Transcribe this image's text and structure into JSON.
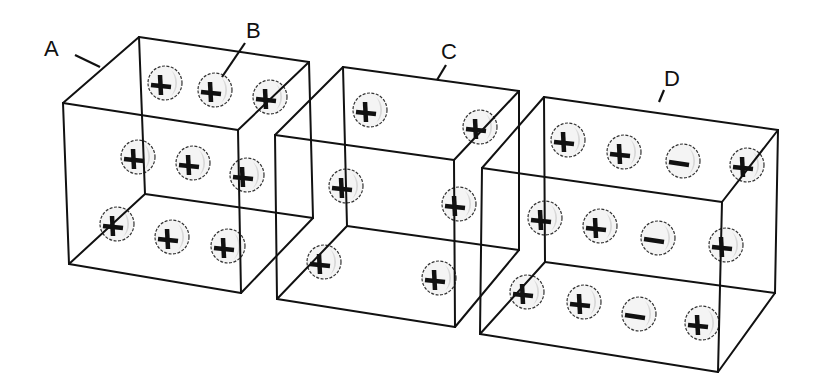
{
  "labels": {
    "A": {
      "text": "A",
      "x": 44,
      "y": 38
    },
    "B": {
      "text": "B",
      "x": 246,
      "y": 20
    },
    "C": {
      "text": "C",
      "x": 441,
      "y": 41
    },
    "D": {
      "text": "D",
      "x": 664,
      "y": 68
    }
  },
  "leaders": [
    {
      "for": "A",
      "x1": 75,
      "y1": 55,
      "x2": 100,
      "y2": 67
    },
    {
      "for": "B",
      "x1": 245,
      "y1": 43,
      "x2": 222,
      "y2": 77
    },
    {
      "for": "C",
      "x1": 446,
      "y1": 65,
      "x2": 437,
      "y2": 80
    },
    {
      "for": "D",
      "x1": 664,
      "y1": 90,
      "x2": 659,
      "y2": 102
    }
  ],
  "cubes": [
    {
      "id": "A",
      "vertices": {
        "btl": [
          139,
          37
        ],
        "btr": [
          309,
          62
        ],
        "bbl": [
          145,
          194
        ],
        "bbr": [
          313,
          218
        ],
        "ftl": [
          63,
          103
        ],
        "ftr": [
          238,
          130
        ],
        "fbl": [
          69,
          264
        ],
        "fbr": [
          241,
          293
        ]
      },
      "charges": [
        {
          "x": 163,
          "y": 83,
          "sign": "+"
        },
        {
          "x": 213,
          "y": 90,
          "sign": "+"
        },
        {
          "x": 268,
          "y": 97,
          "sign": "+"
        },
        {
          "x": 136,
          "y": 157,
          "sign": "+"
        },
        {
          "x": 191,
          "y": 163,
          "sign": "+"
        },
        {
          "x": 245,
          "y": 175,
          "sign": "+"
        },
        {
          "x": 115,
          "y": 224,
          "sign": "+"
        },
        {
          "x": 170,
          "y": 237,
          "sign": "+"
        },
        {
          "x": 226,
          "y": 246,
          "sign": "+"
        }
      ]
    },
    {
      "id": "C",
      "vertices": {
        "btl": [
          343,
          67
        ],
        "btr": [
          519,
          91
        ],
        "bbl": [
          347,
          226
        ],
        "bbr": [
          519,
          250
        ],
        "ftl": [
          275,
          135
        ],
        "ftr": [
          454,
          160
        ],
        "fbl": [
          277,
          299
        ],
        "fbr": [
          455,
          327
        ]
      },
      "charges": [
        {
          "x": 368,
          "y": 110,
          "sign": "+"
        },
        {
          "x": 478,
          "y": 127,
          "sign": "+"
        },
        {
          "x": 344,
          "y": 186,
          "sign": "+"
        },
        {
          "x": 457,
          "y": 204,
          "sign": "+"
        },
        {
          "x": 322,
          "y": 262,
          "sign": "+"
        },
        {
          "x": 437,
          "y": 278,
          "sign": "+"
        }
      ]
    },
    {
      "id": "D",
      "vertices": {
        "btl": [
          544,
          97
        ],
        "btr": [
          778,
          130
        ],
        "bbl": [
          545,
          262
        ],
        "bbr": [
          775,
          293
        ],
        "ftl": [
          482,
          168
        ],
        "ftr": [
          722,
          202
        ],
        "fbl": [
          480,
          334
        ],
        "fbr": [
          718,
          372
        ]
      },
      "charges": [
        {
          "x": 566,
          "y": 140,
          "sign": "+"
        },
        {
          "x": 622,
          "y": 152,
          "sign": "+"
        },
        {
          "x": 681,
          "y": 161,
          "sign": "-"
        },
        {
          "x": 745,
          "y": 165,
          "sign": "+"
        },
        {
          "x": 543,
          "y": 218,
          "sign": "+"
        },
        {
          "x": 598,
          "y": 226,
          "sign": "+"
        },
        {
          "x": 656,
          "y": 238,
          "sign": "-"
        },
        {
          "x": 724,
          "y": 245,
          "sign": "+"
        },
        {
          "x": 525,
          "y": 292,
          "sign": "+"
        },
        {
          "x": 582,
          "y": 302,
          "sign": "+"
        },
        {
          "x": 637,
          "y": 314,
          "sign": "-"
        },
        {
          "x": 700,
          "y": 323,
          "sign": "+"
        }
      ]
    }
  ],
  "style": {
    "edge_color": "#111111",
    "ball_fill": "#f4f4f4",
    "ball_shade": "#d8d8d8",
    "background": "#ffffff"
  }
}
